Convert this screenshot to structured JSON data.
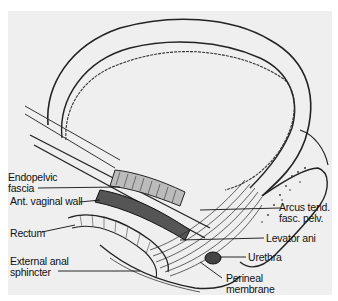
{
  "figure": {
    "labels_left": [
      {
        "id": "endopelvic",
        "line1": "Endopelvic",
        "line2": "fascia"
      },
      {
        "id": "vaginal",
        "line1": "Ant. vaginal wall"
      },
      {
        "id": "rectum",
        "line1": "Rectum"
      },
      {
        "id": "anal",
        "line1": "External anal",
        "line2": "sphincter"
      }
    ],
    "labels_right": [
      {
        "id": "arcus",
        "line1": "Arcus tend.",
        "line2": "fasc. pelv."
      },
      {
        "id": "levator",
        "line1": "Levator ani"
      },
      {
        "id": "urethra",
        "line1": "Urethra"
      },
      {
        "id": "perineal",
        "line1": "Perineal",
        "line2": "membrane"
      }
    ]
  }
}
